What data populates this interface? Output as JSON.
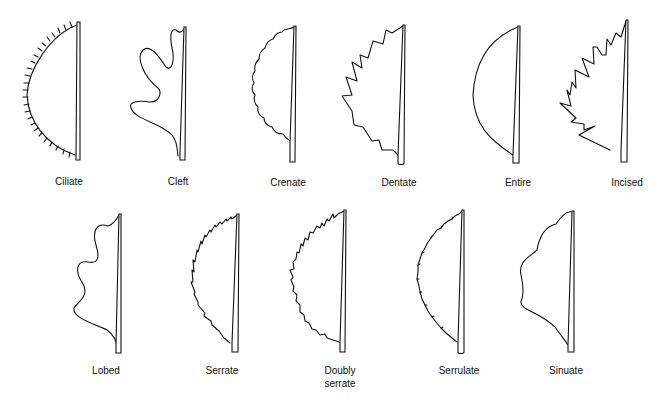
{
  "figure": {
    "rows": [
      {
        "items": [
          {
            "id": "ciliate",
            "label": "Ciliate"
          },
          {
            "id": "cleft",
            "label": "Cleft"
          },
          {
            "id": "crenate",
            "label": "Crenate"
          },
          {
            "id": "dentate",
            "label": "Dentate"
          },
          {
            "id": "entire",
            "label": "Entire"
          },
          {
            "id": "incised",
            "label": "Incised"
          }
        ]
      },
      {
        "items": [
          {
            "id": "lobed",
            "label": "Lobed"
          },
          {
            "id": "serrate",
            "label": "Serrate"
          },
          {
            "id": "doubly_serrate",
            "label": "Doubly serrate",
            "label_line1": "Doubly",
            "label_line2": "serrate"
          },
          {
            "id": "serrulate",
            "label": "Serrulate"
          },
          {
            "id": "sinuate",
            "label": "Sinuate"
          }
        ]
      }
    ]
  }
}
